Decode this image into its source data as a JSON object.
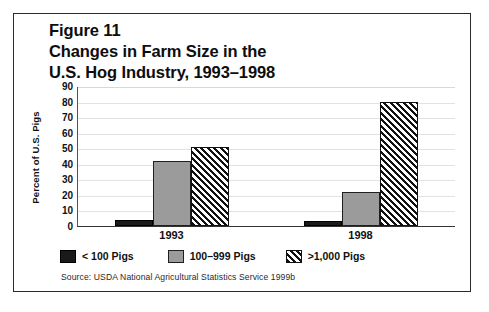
{
  "figure": {
    "title_lines": [
      "Figure 11",
      "Changes in Farm Size in the",
      "U.S. Hog Industry, 1993–1998"
    ],
    "source": "Source: USDA National Agricultural Statistics Service 1999b"
  },
  "chart_data": {
    "type": "bar",
    "title": "Figure 11 Changes in Farm Size in the U.S. Hog Industry, 1993–1998",
    "xlabel": "",
    "ylabel": "Percent of U.S. Pigs",
    "categories": [
      "1993",
      "1998"
    ],
    "series": [
      {
        "name": "< 100 Pigs",
        "values": [
          4,
          3
        ]
      },
      {
        "name": "100–999 Pigs",
        "values": [
          42,
          22
        ]
      },
      {
        "name": ">1,000 Pigs",
        "values": [
          51,
          80
        ]
      }
    ],
    "ylim": [
      0,
      90
    ],
    "yticks": [
      0,
      10,
      20,
      30,
      40,
      50,
      60,
      70,
      80,
      90
    ],
    "ytick_labels": [
      "0",
      "10",
      "20",
      "30",
      "40",
      "50",
      "60",
      "70",
      "80",
      "90"
    ],
    "grid": true,
    "legend_position": "bottom-left",
    "legend_entries": [
      "< 100 Pigs",
      "100–999 Pigs",
      ">1,000 Pigs"
    ],
    "colors": {
      "lt100": "#1a1a1a",
      "mid": "#9b9b9b",
      "gt1000_pattern": "diagonal-hatch",
      "gridline": "#e2e2e2",
      "axis": "#333333",
      "background": "#ffffff",
      "frame_border": "#2b2b2b"
    }
  }
}
